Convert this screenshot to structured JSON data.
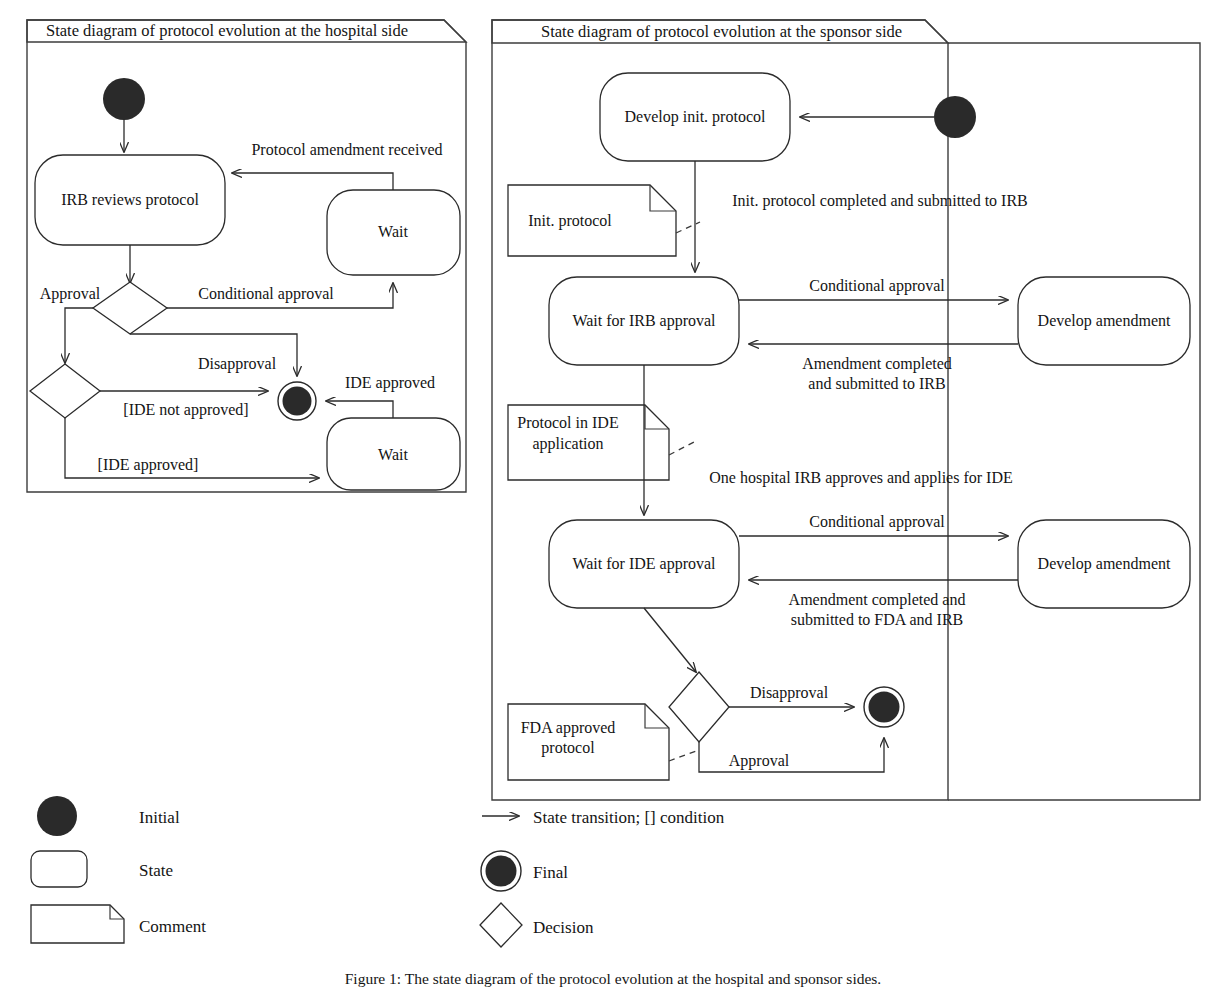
{
  "figure": {
    "caption": "Figure 1: The state diagram of the protocol evolution at the hospital and sponsor sides."
  },
  "panels": [
    {
      "id": "hospital",
      "title": "State diagram of protocol evolution at the hospital side",
      "states": [
        {
          "id": "irb-reviews-protocol",
          "label": "IRB reviews protocol"
        },
        {
          "id": "wait-top",
          "label": "Wait"
        },
        {
          "id": "wait-bottom",
          "label": "Wait"
        }
      ],
      "initial_nodes": [
        {
          "id": "initial"
        }
      ],
      "final_nodes": [
        {
          "id": "final"
        }
      ],
      "decisions": [
        {
          "id": "decision-approval"
        },
        {
          "id": "decision-ide"
        }
      ],
      "transitions": [
        {
          "id": "t-protocol-amendment-received",
          "label": "Protocol amendment received"
        },
        {
          "id": "t-approval",
          "label": "Approval"
        },
        {
          "id": "t-conditional-approval",
          "label": "Conditional approval"
        },
        {
          "id": "t-disapproval",
          "label": "Disapproval"
        },
        {
          "id": "t-ide-approved-event",
          "label": "IDE approved"
        },
        {
          "id": "t-ide-not-approved",
          "label": "[IDE not approved]"
        },
        {
          "id": "t-ide-approved",
          "label": "[IDE approved]"
        }
      ]
    },
    {
      "id": "sponsor",
      "title": "State diagram of protocol evolution at the sponsor side",
      "states": [
        {
          "id": "develop-init-protocol",
          "label": "Develop init. protocol"
        },
        {
          "id": "wait-for-irb-approval",
          "label": "Wait for IRB approval"
        },
        {
          "id": "develop-amendment-irb",
          "label": "Develop amendment"
        },
        {
          "id": "wait-for-ide-approval",
          "label": "Wait for IDE approval"
        },
        {
          "id": "develop-amendment-ide",
          "label": "Develop amendment"
        }
      ],
      "initial_nodes": [
        {
          "id": "initial"
        }
      ],
      "final_nodes": [
        {
          "id": "final"
        }
      ],
      "decisions": [
        {
          "id": "decision-fda"
        }
      ],
      "comments": [
        {
          "id": "comment-init-protocol",
          "lines": [
            "Init. protocol"
          ]
        },
        {
          "id": "comment-protocol-in-ide",
          "lines": [
            "Protocol in IDE",
            "application"
          ]
        },
        {
          "id": "comment-fda-approved",
          "lines": [
            "FDA approved",
            "protocol"
          ]
        }
      ],
      "transitions": [
        {
          "id": "t-init-submitted",
          "label": "Init. protocol completed and submitted to IRB"
        },
        {
          "id": "t-cond-approval-irb",
          "label": "Conditional approval"
        },
        {
          "id": "t-amendment-irb",
          "lines": [
            "Amendment completed",
            "and submitted to IRB"
          ]
        },
        {
          "id": "t-one-hospital-irb",
          "label": "One hospital IRB approves and applies for IDE"
        },
        {
          "id": "t-cond-approval-ide",
          "label": "Conditional approval"
        },
        {
          "id": "t-amendment-fda",
          "lines": [
            "Amendment completed and",
            "submitted to FDA and IRB"
          ]
        },
        {
          "id": "t-disapproval-fda",
          "label": "Disapproval"
        },
        {
          "id": "t-approval-fda",
          "label": "Approval"
        }
      ]
    }
  ],
  "legend": {
    "left_items": [
      {
        "id": "legend-initial",
        "label": "Initial",
        "glyph": "filled-circle-icon"
      },
      {
        "id": "legend-state",
        "label": "State",
        "glyph": "rounded-rect-icon"
      },
      {
        "id": "legend-comment",
        "label": "Comment",
        "glyph": "note-icon"
      }
    ],
    "right_items": [
      {
        "id": "legend-transition",
        "label": "State transition; [] condition",
        "glyph": "arrow-right-icon"
      },
      {
        "id": "legend-final",
        "label": "Final",
        "glyph": "ringed-circle-icon"
      },
      {
        "id": "legend-decision",
        "label": "Decision",
        "glyph": "diamond-icon"
      }
    ]
  },
  "colors": {
    "ink": "#2a2a2a",
    "frame": "#3d3d3d",
    "paper": "#ffffff"
  }
}
